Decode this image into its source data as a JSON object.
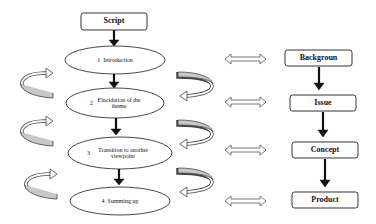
{
  "diagram": {
    "left_flow": {
      "start": {
        "label": "Script"
      },
      "steps": [
        {
          "number": "1",
          "label": "Introduction"
        },
        {
          "number": "2",
          "label": "Elucidation of the theme"
        },
        {
          "number": "3",
          "label": "Transition to another viewpoint"
        },
        {
          "number": "4",
          "label": "Summing up"
        }
      ]
    },
    "right_flow": {
      "steps": [
        {
          "label": "Backgroun"
        },
        {
          "label": "Issue"
        },
        {
          "label": "Concept"
        },
        {
          "label": "Product"
        }
      ]
    },
    "connectors": {
      "vertical_arrows": "down-arrow",
      "cross_links": "double-headed-hollow-arrow",
      "cycle_arrows": "curved-loop-arrow"
    },
    "colors": {
      "stroke": "#222222",
      "arrow_fill_light": "#ffffff",
      "band_fill": "#c8c8c8",
      "background": "#ffffff"
    }
  }
}
